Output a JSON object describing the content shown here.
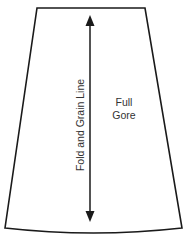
{
  "diagram": {
    "piece_label_lines": [
      "Full",
      "Gore"
    ],
    "grain_line_label": "Fold and Grain Line",
    "colors": {
      "outline": "#1a1a1a",
      "text": "#333333",
      "background": "#ffffff"
    },
    "shape": {
      "type": "trapezoid-with-curved-hem",
      "top_left": [
        37,
        8
      ],
      "top_right": [
        145,
        8
      ],
      "bottom_right": [
        182,
        228
      ],
      "bottom_left": [
        5,
        228
      ],
      "hem_center_y": 233
    },
    "arrow": {
      "type": "double-headed",
      "x": 90,
      "top_y": 15,
      "bottom_y": 222
    }
  }
}
